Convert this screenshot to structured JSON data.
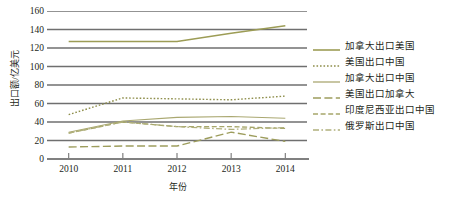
{
  "chart_data": {
    "type": "line",
    "title": "",
    "xlabel": "年份",
    "ylabel": "出口额/亿美元",
    "x": [
      2010,
      2011,
      2012,
      2013,
      2014
    ],
    "categories": [
      "2010",
      "2011",
      "2012",
      "2013",
      "2014"
    ],
    "xlim": [
      2009.6,
      2014.4
    ],
    "ylim": [
      0,
      160
    ],
    "yticks": [
      0,
      20,
      40,
      60,
      80,
      100,
      120,
      140,
      160
    ],
    "ytick_labels": [
      "0",
      "20",
      "40",
      "60",
      "80",
      "100",
      "120",
      "140",
      "160"
    ],
    "xtick_labels": [
      "2010",
      "2011",
      "2012",
      "2013",
      "2014"
    ],
    "grid": "horizontal",
    "legend_position": "right",
    "series": [
      {
        "name": "加拿大出口美国",
        "values": [
          127,
          127,
          127,
          136,
          144
        ],
        "color": "#9c9c55",
        "dash": "solid",
        "width": 1.4
      },
      {
        "name": "美国出口中国",
        "values": [
          48,
          66,
          65,
          64,
          68
        ],
        "color": "#8e8e4b",
        "dash": "dotted",
        "width": 1.4
      },
      {
        "name": "加拿大出口中国",
        "values": [
          29,
          41,
          45,
          46,
          44
        ],
        "color": "#aaa871",
        "dash": "solid",
        "width": 1.1
      },
      {
        "name": "美国出口加拿大",
        "values": [
          13,
          14,
          14,
          29,
          19
        ],
        "color": "#9d9d5d",
        "dash": "dashed-long",
        "width": 1.4
      },
      {
        "name": "印度尼西亚出口中国",
        "values": [
          28,
          40,
          35,
          35,
          33
        ],
        "color": "#a7a76b",
        "dash": "dashed",
        "width": 1.3
      },
      {
        "name": "俄罗斯出口中国",
        "values": [
          28,
          40,
          35,
          32,
          34
        ],
        "color": "#b0b07c",
        "dash": "dash-dot",
        "width": 1.3
      }
    ]
  },
  "axes": {
    "y_title": "出口额/亿美元",
    "x_title": "年份",
    "y_ticks": [
      "160",
      "140",
      "120",
      "100",
      "80",
      "60",
      "40",
      "20",
      "0"
    ],
    "x_ticks": [
      "2010",
      "2011",
      "2012",
      "2013",
      "2014"
    ]
  },
  "legend": {
    "items": [
      {
        "label": "加拿大出口美国"
      },
      {
        "label": "美国出口中国"
      },
      {
        "label": "加拿大出口中国"
      },
      {
        "label": "美国出口加拿大"
      },
      {
        "label": "印度尼西亚出口中国"
      },
      {
        "label": "俄罗斯出口中国"
      }
    ]
  },
  "colors": {
    "gridline": "#6f6f6f",
    "axis": "#808080",
    "text": "#231f20",
    "background": "#ffffff"
  }
}
